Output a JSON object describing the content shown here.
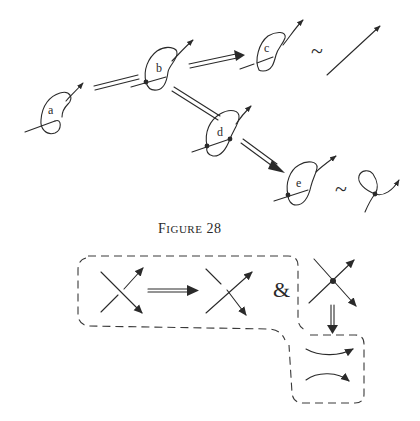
{
  "figure": {
    "caption_first": "F",
    "caption_rest": "IGURE",
    "caption_number": "28"
  },
  "knots": [
    {
      "id": "a",
      "label": "a"
    },
    {
      "id": "b",
      "label": "b"
    },
    {
      "id": "c",
      "label": "c"
    },
    {
      "id": "d",
      "label": "d"
    },
    {
      "id": "e",
      "label": "e"
    }
  ],
  "symbols": {
    "equivalent": "~",
    "and": "&"
  },
  "colors": {
    "ink": "#2a2a2a",
    "background": "#ffffff"
  }
}
